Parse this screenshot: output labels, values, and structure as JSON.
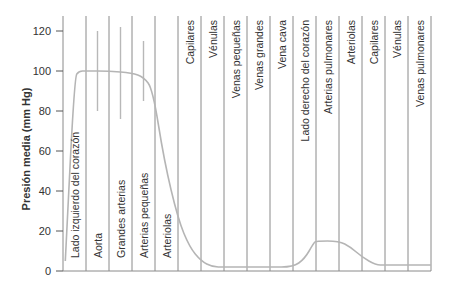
{
  "chart_data": {
    "type": "line",
    "title": "",
    "xlabel": "",
    "ylabel": "Presión media (mm Hg)",
    "ylim": [
      0,
      125
    ],
    "yticks": [
      0,
      20,
      40,
      60,
      80,
      100,
      120
    ],
    "grid": "vertical column dividers",
    "legend": "none",
    "categories": [
      "Lado izquierdo del corazón",
      "Aorta",
      "Grandes arterias",
      "Arterias pequeñas",
      "Arteriolas",
      "Capilares",
      "Vénulas",
      "Venas pequeñas",
      "Venas grandes",
      "Vena cava",
      "Lado derecho del corazón",
      "Arterias pulmonares",
      "Arteriolas",
      "Capilares",
      "Vénulas",
      "Venas pulmonares"
    ],
    "series": [
      {
        "name": "Presión media",
        "values": [
          100,
          100,
          100,
          95,
          30,
          10,
          3,
          2,
          2,
          2,
          2,
          15,
          12,
          6,
          3,
          3
        ],
        "curve_points": [
          [
            0.1,
            5
          ],
          [
            0.5,
            97
          ],
          [
            0.7,
            100
          ],
          [
            1.0,
            100
          ],
          [
            2.0,
            100
          ],
          [
            3.0,
            99
          ],
          [
            3.5,
            97
          ],
          [
            3.9,
            91
          ],
          [
            4.4,
            55
          ],
          [
            5.0,
            26
          ],
          [
            5.5,
            12
          ],
          [
            6.0,
            5
          ],
          [
            6.5,
            2
          ],
          [
            7.0,
            2
          ],
          [
            8.0,
            2
          ],
          [
            9.0,
            2
          ],
          [
            10.0,
            2
          ],
          [
            10.5,
            6
          ],
          [
            10.9,
            14
          ],
          [
            11.0,
            15
          ],
          [
            12.0,
            15
          ],
          [
            12.5,
            12
          ],
          [
            13.0,
            7
          ],
          [
            13.6,
            3
          ],
          [
            14.0,
            3
          ],
          [
            16.0,
            3
          ]
        ]
      }
    ],
    "pulsatile_ranges": [
      {
        "category": "Aorta",
        "min": 80,
        "max": 120
      },
      {
        "category": "Grandes arterias",
        "min": 76,
        "max": 122
      },
      {
        "category": "Arterias pequeñas",
        "min": 85,
        "max": 115
      }
    ]
  },
  "colors": {
    "axis": "#555555",
    "grid": "#8a8a8a",
    "curve": "#b5b5b5",
    "range_bars": "#b8b8b8",
    "text": "#333333"
  }
}
